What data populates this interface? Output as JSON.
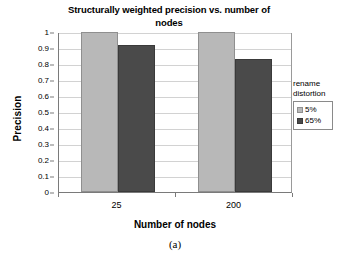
{
  "chart_data": {
    "type": "bar",
    "title": "Structurally weighted precision vs. number of nodes",
    "title_line1": "Structurally weighted precision vs. number of",
    "title_line2": "nodes",
    "xlabel": "Number of nodes",
    "ylabel": "Precision",
    "categories": [
      "25",
      "200"
    ],
    "series": [
      {
        "name": "5%",
        "values": [
          1.0,
          1.0
        ],
        "color": "#b8b8b8"
      },
      {
        "name": "65%",
        "values": [
          0.92,
          0.83
        ],
        "color": "#4a4a4a"
      }
    ],
    "ylim": [
      0,
      1
    ],
    "ytick_labels": [
      "1",
      "0.9",
      "0.8",
      "0.7",
      "0.6",
      "0.5",
      "0.4",
      "0.3",
      "0.2",
      "0.1",
      "0"
    ],
    "ytick_values": [
      1,
      0.9,
      0.8,
      0.7,
      0.6,
      0.5,
      0.4,
      0.3,
      0.2,
      0.1,
      0
    ],
    "grid": true,
    "legend": {
      "position": "right",
      "title_line1": "rename",
      "title_line2": "distortion",
      "entries": [
        "5%",
        "65%"
      ]
    }
  },
  "caption": "(a)"
}
